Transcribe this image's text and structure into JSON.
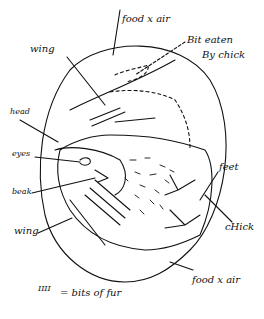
{
  "diagram": {
    "stroke_color": "#111111",
    "background": "#ffffff"
  },
  "labels": {
    "food_air_top": "food x air",
    "bit_eaten_1": "Bit eaten",
    "bit_eaten_2": "By chick",
    "wing_top": "wing",
    "head": "head",
    "eyes": "eyes",
    "beak": "beak",
    "wing_bottom": "wing",
    "feet": "feet",
    "chick": "cHick",
    "food_air_bottom": "food x air"
  },
  "legend": {
    "symbol": "IIII",
    "text": "= bits of fur"
  }
}
